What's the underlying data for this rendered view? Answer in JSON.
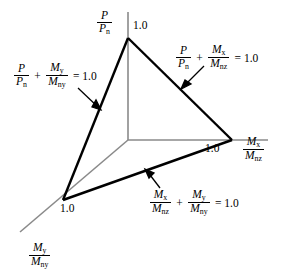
{
  "figure": {
    "type": "3d-interaction-surface-diagram",
    "background_color": "#ffffff",
    "line_color": "#000000",
    "axis_color": "#808080",
    "width": 287,
    "height": 280
  },
  "axes": [
    {
      "id": "vertical",
      "name": "axial-load-ratio",
      "numerator": "P",
      "denominator": "P",
      "denominator_sub": "n",
      "tick_label": "1.0",
      "direction": "up"
    },
    {
      "id": "right",
      "name": "moment-z-ratio",
      "numerator": "M",
      "numerator_sub": "x",
      "denominator": "M",
      "denominator_sub": "nz",
      "tick_label": "1.0",
      "direction": "right"
    },
    {
      "id": "lower-left",
      "name": "moment-y-ratio",
      "numerator": "M",
      "numerator_sub": "y",
      "denominator": "M",
      "denominator_sub": "ny",
      "tick_label": "1.0",
      "direction": "lower-left"
    }
  ],
  "equations": [
    {
      "id": "left-face",
      "name": "axial-plus-moment-y",
      "terms": [
        {
          "num": "P",
          "num_sub": "",
          "den": "P",
          "den_sub": "n"
        },
        {
          "num": "M",
          "num_sub": "y",
          "den": "M",
          "den_sub": "ny"
        }
      ],
      "operator": "+",
      "equals": "= 1.0"
    },
    {
      "id": "right-face",
      "name": "axial-plus-moment-z",
      "terms": [
        {
          "num": "P",
          "num_sub": "",
          "den": "P",
          "den_sub": "n"
        },
        {
          "num": "M",
          "num_sub": "x",
          "den": "M",
          "den_sub": "nz"
        }
      ],
      "operator": "+",
      "equals": "= 1.0"
    },
    {
      "id": "bottom-face",
      "name": "biaxial-moment",
      "terms": [
        {
          "num": "M",
          "num_sub": "x",
          "den": "M",
          "den_sub": "nz"
        },
        {
          "num": "M",
          "num_sub": "y",
          "den": "M",
          "den_sub": "ny"
        }
      ],
      "operator": "+",
      "equals": "= 1.0"
    }
  ],
  "geometry": {
    "origin": [
      128,
      140
    ],
    "apex_top": [
      128,
      38
    ],
    "vertex_right": [
      232,
      140
    ],
    "vertex_lower_left": [
      63,
      200
    ],
    "axis_top_end": [
      128,
      12
    ],
    "axis_right_end": [
      268,
      140
    ],
    "axis_lower_left_end": [
      20,
      232
    ]
  },
  "tick_labels": {
    "top": "1.0",
    "right": "1.0",
    "lower_left": "1.0"
  }
}
